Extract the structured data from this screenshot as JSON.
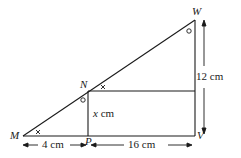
{
  "diagram": {
    "points": {
      "M": {
        "label": "M",
        "x": 23,
        "y": 136
      },
      "P": {
        "label": "P",
        "x": 88,
        "y": 136
      },
      "V": {
        "label": "V",
        "x": 195,
        "y": 136
      },
      "W": {
        "label": "W",
        "x": 195,
        "y": 20
      },
      "N": {
        "label": "N",
        "x": 88,
        "y": 91
      }
    },
    "measurements": {
      "MP": "4 cm",
      "PV": "16 cm",
      "WV": "12 cm",
      "NP_var": "x",
      "NP_unit": "cm"
    },
    "angle_marks": {
      "cross": "×",
      "circle": "○"
    },
    "colors": {
      "line": "#1a1a1a",
      "background": "#ffffff"
    }
  }
}
